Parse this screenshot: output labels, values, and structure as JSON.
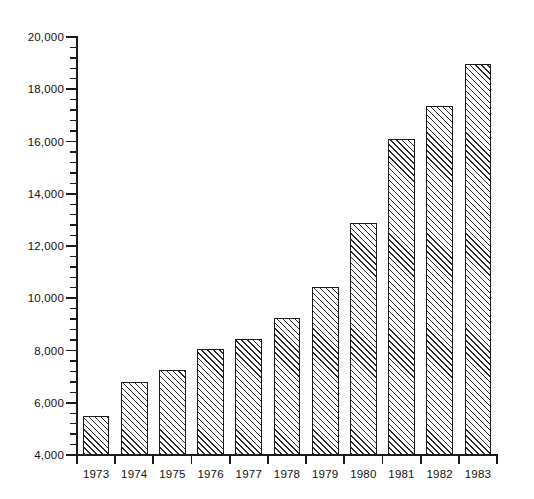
{
  "chart_data": {
    "type": "bar",
    "title": "",
    "subtitle": "",
    "xlabel": "",
    "ylabel": "",
    "categories": [
      "1973",
      "1974",
      "1975",
      "1976",
      "1977",
      "1978",
      "1979",
      "1980",
      "1981",
      "1982",
      "1983"
    ],
    "values": [
      5500,
      6800,
      7250,
      8050,
      8450,
      9250,
      10450,
      12900,
      16100,
      17350,
      18950
    ],
    "series": [
      {
        "name": "",
        "values": [
          5500,
          6800,
          7250,
          8050,
          8450,
          9250,
          10450,
          12900,
          16100,
          17350,
          18950
        ]
      }
    ],
    "ylim": [
      4000,
      20000
    ],
    "y_major_ticks": [
      4000,
      6000,
      8000,
      10000,
      12000,
      14000,
      16000,
      18000,
      20000
    ],
    "y_major_tick_labels": [
      "4,000",
      "6,000",
      "8,000",
      "10,000",
      "12,000",
      "14,000",
      "16,000",
      "18,000",
      "20,000"
    ],
    "y_minor_tick_interval": 400,
    "grid": false,
    "legend": null,
    "legend_position": "none",
    "annotations": [],
    "bar_style": {
      "fill": "diagonal-hatch",
      "fill_color": "#ffffff",
      "hatch_color": "#2b2b2b",
      "edge_color": "#1a1a1a",
      "hatch_direction": "forward-slash"
    },
    "axis_color": "#1a1a1a",
    "background_color": "#ffffff",
    "text_color": "#111111"
  }
}
